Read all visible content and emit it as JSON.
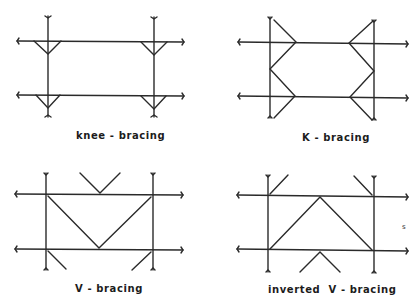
{
  "figure": {
    "panels": [
      {
        "id": "knee",
        "label": "knee - bracing"
      },
      {
        "id": "k",
        "label": "K - bracing"
      },
      {
        "id": "v",
        "label": "V - bracing"
      },
      {
        "id": "inverted-v",
        "label": "inverted  V - bracing"
      }
    ],
    "stray_mark": "s"
  },
  "colors": {
    "line": "#2a2a2a",
    "background": "#ffffff"
  }
}
